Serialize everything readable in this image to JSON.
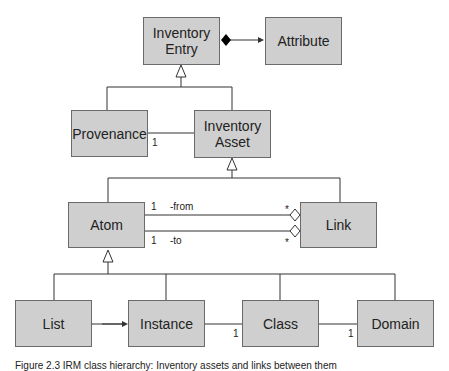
{
  "diagram": {
    "classes": {
      "inventory_entry": "Inventory\nEntry",
      "attribute": "Attribute",
      "provenance": "Provenance",
      "inventory_asset": "Inventory\nAsset",
      "atom": "Atom",
      "link": "Link",
      "list": "List",
      "instance": "Instance",
      "class": "Class",
      "domain": "Domain"
    },
    "labels": {
      "provenance_mult": "1",
      "from_mult_atom": "1",
      "from_role": "-from",
      "from_mult_link": "*",
      "to_mult_atom": "1",
      "to_role": "-to",
      "to_mult_link": "*",
      "instance_class_mult": "1",
      "class_domain_mult": "1"
    },
    "caption": "Figure 2.3   IRM class hierarchy: Inventory assets and links between them"
  }
}
